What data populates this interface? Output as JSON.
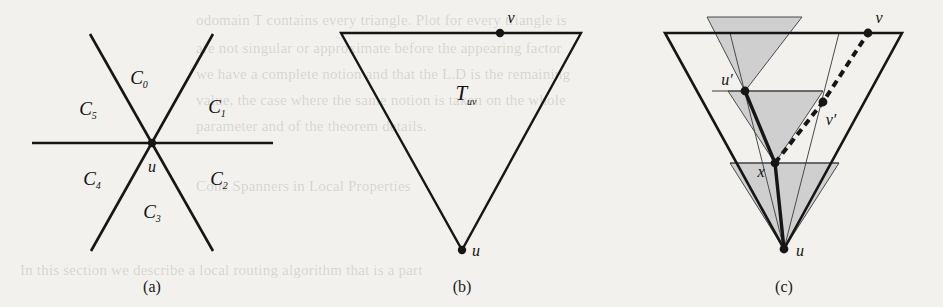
{
  "figure": {
    "background_color": "#f3f1ee",
    "ink_color": "#161616",
    "shade_color": "#c8c8c8",
    "panels": [
      {
        "id": "a",
        "caption": "(a)",
        "description": "Six cones around vertex u",
        "vertex_label": "u",
        "cone_labels": [
          "C0",
          "C1",
          "C2",
          "C3",
          "C4",
          "C5"
        ],
        "cone_label_base": "C",
        "cone_label_subscripts": [
          "0",
          "1",
          "2",
          "3",
          "4",
          "5"
        ]
      },
      {
        "id": "b",
        "caption": "(b)",
        "description": "Downward triangle T_uv",
        "region_label_base": "T",
        "region_label_sub": "uv",
        "point_labels": [
          "v",
          "u"
        ]
      },
      {
        "id": "c",
        "caption": "(c)",
        "description": "Nested cones with path from u to v",
        "point_labels": [
          "v",
          "u",
          "x"
        ],
        "primed_point_labels": [
          "u'",
          "v'"
        ],
        "label_u": "u",
        "label_v": "v",
        "label_x": "x",
        "label_u_prime": "u",
        "label_v_prime": "v",
        "prime_mark": "′"
      }
    ]
  },
  "bleedthrough": {
    "description": "faint text showing through from the reverse page",
    "lines": [
      {
        "text": "odomain  T  contains every  triangle. Plot  for every  triangle is",
        "x": 196,
        "y": 12
      },
      {
        "text": "are  not  singular  or  approximate  before  the  appearing  factor",
        "x": 196,
        "y": 40
      },
      {
        "text": "we  have  a  complete  notion  and  that  the  L.D  is  the  remaining",
        "x": 196,
        "y": 66
      },
      {
        "text": "value, the  case  where  the  same  notion  is  taken  on  the  whole",
        "x": 196,
        "y": 92
      },
      {
        "text": "parameter  and  of  the  theorem  details.",
        "x": 196,
        "y": 118
      },
      {
        "text": "Cone  Spanners  in  Local  Properties",
        "x": 196,
        "y": 178
      },
      {
        "text": "In  this  section  we  describe  a  local  routing  algorithm  that  is  a  part",
        "x": 20,
        "y": 262
      }
    ]
  }
}
